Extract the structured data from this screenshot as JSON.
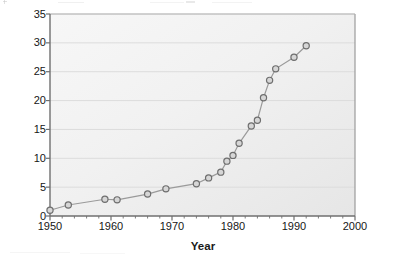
{
  "chart_data": {
    "type": "line",
    "title": "",
    "xlabel": "Year",
    "ylabel": "Number of journals",
    "xlim": [
      1950,
      2000
    ],
    "ylim": [
      0,
      35
    ],
    "xticks": [
      1950,
      1960,
      1970,
      1980,
      1990,
      2000
    ],
    "xtick_labels": [
      "1950",
      "1960",
      "1970",
      "1980",
      "1990",
      "2000"
    ],
    "yticks": [
      0,
      5,
      10,
      15,
      20,
      25,
      30,
      35
    ],
    "ytick_labels": [
      "0",
      "5",
      "10",
      "15",
      "20",
      "25",
      "30",
      "35"
    ],
    "x_minor_tick_interval": 2,
    "grid": "horizontal",
    "legend": "none",
    "marker": "open-circle",
    "series": [
      {
        "name": "Number of journals",
        "x": [
          1950,
          1953,
          1959,
          1961,
          1966,
          1969,
          1974,
          1976,
          1978,
          1979,
          1980,
          1981,
          1983,
          1984,
          1985,
          1986,
          1987,
          1990,
          1992
        ],
        "values": [
          1.0,
          1.9,
          2.9,
          2.8,
          3.8,
          4.7,
          5.6,
          6.6,
          7.6,
          9.5,
          10.5,
          12.6,
          15.6,
          16.6,
          20.5,
          23.5,
          25.5,
          27.5,
          29.5
        ],
        "line_color": "#9a9a9a",
        "marker_edge_color": "#6e6e6e",
        "marker_face_color": "#d6d6d6"
      }
    ],
    "colors": {
      "plot_background": "#efefef",
      "axis_line": "#8a8a8a",
      "gridline": "#dcdcdc",
      "text": "#161616"
    }
  }
}
